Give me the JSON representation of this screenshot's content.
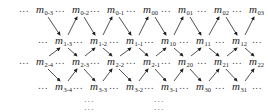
{
  "diagram": {
    "type": "lattice",
    "rows": [
      {
        "row": 0,
        "terms": [
          "0-3",
          "0-2",
          "0-1",
          "00",
          "01",
          "02",
          "03"
        ],
        "x": [
          36,
          72,
          107,
          143,
          178,
          214,
          249
        ],
        "y": 3
      },
      {
        "row": 1,
        "terms": [
          "1-3",
          "1-2",
          "1-1",
          "10",
          "11",
          "12"
        ],
        "x": [
          55,
          90,
          126,
          161,
          196,
          232
        ],
        "y": 34
      },
      {
        "row": 2,
        "terms": [
          "2-4",
          "2-3",
          "2-2",
          "2-1",
          "20",
          "21",
          "22"
        ],
        "x": [
          36,
          72,
          107,
          143,
          178,
          214,
          249
        ],
        "y": 55
      },
      {
        "row": 3,
        "terms": [
          "3-4",
          "3-3",
          "3-2",
          "3-1",
          "30",
          "31"
        ],
        "x": [
          55,
          90,
          126,
          161,
          196,
          232
        ],
        "y": 80
      }
    ],
    "symbol": "m",
    "ellipsis": "...",
    "vertical_ellipsis": "...",
    "vertical_dots_x": [
      84,
      154
    ],
    "vertical_dots_y": [
      95,
      103
    ],
    "colors": {
      "text": "#222222",
      "arrow": "#222222",
      "background": "#ffffff"
    }
  }
}
